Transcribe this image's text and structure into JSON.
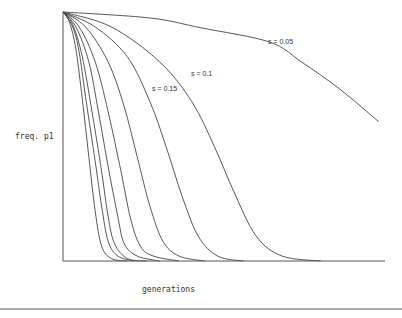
{
  "chart_data": {
    "type": "line",
    "title": "",
    "xlabel": "generations",
    "ylabel": "freq. p1",
    "xlim": [
      0,
      100
    ],
    "ylim": [
      0,
      1
    ],
    "grid": false,
    "legend": "inline curve labels",
    "series": [
      {
        "name": "curve-1",
        "label": "",
        "points": [
          [
            0,
            1
          ],
          [
            2,
            0.96
          ],
          [
            4,
            0.85
          ],
          [
            6,
            0.65
          ],
          [
            8,
            0.42
          ],
          [
            10,
            0.2
          ],
          [
            12,
            0.06
          ],
          [
            15,
            0.01
          ],
          [
            20,
            0
          ]
        ]
      },
      {
        "name": "curve-2",
        "label": "",
        "points": [
          [
            0,
            1
          ],
          [
            3,
            0.94
          ],
          [
            5,
            0.84
          ],
          [
            7,
            0.66
          ],
          [
            10,
            0.4
          ],
          [
            12,
            0.22
          ],
          [
            14,
            0.08
          ],
          [
            17,
            0.02
          ],
          [
            22,
            0
          ]
        ]
      },
      {
        "name": "curve-3",
        "label": "",
        "points": [
          [
            0,
            1
          ],
          [
            3,
            0.95
          ],
          [
            6,
            0.82
          ],
          [
            9,
            0.6
          ],
          [
            12,
            0.36
          ],
          [
            14,
            0.18
          ],
          [
            16,
            0.07
          ],
          [
            20,
            0.01
          ],
          [
            26,
            0
          ]
        ]
      },
      {
        "name": "curve-4",
        "label": "",
        "points": [
          [
            0,
            1
          ],
          [
            4,
            0.94
          ],
          [
            8,
            0.8
          ],
          [
            11,
            0.6
          ],
          [
            14,
            0.38
          ],
          [
            17,
            0.18
          ],
          [
            19,
            0.07
          ],
          [
            23,
            0.02
          ],
          [
            30,
            0
          ]
        ]
      },
      {
        "name": "curve-5",
        "label": "",
        "points": [
          [
            0,
            1
          ],
          [
            5,
            0.94
          ],
          [
            10,
            0.8
          ],
          [
            14,
            0.6
          ],
          [
            18,
            0.36
          ],
          [
            21,
            0.17
          ],
          [
            24,
            0.06
          ],
          [
            28,
            0.02
          ],
          [
            36,
            0
          ]
        ]
      },
      {
        "name": "curve-6",
        "label": "",
        "points": [
          [
            0,
            1
          ],
          [
            7,
            0.94
          ],
          [
            14,
            0.8
          ],
          [
            19,
            0.62
          ],
          [
            23,
            0.42
          ],
          [
            27,
            0.22
          ],
          [
            31,
            0.08
          ],
          [
            36,
            0.02
          ],
          [
            44,
            0
          ]
        ]
      },
      {
        "name": "s=0.15",
        "label": "s = 0.15",
        "points": [
          [
            0,
            1
          ],
          [
            10,
            0.94
          ],
          [
            20,
            0.82
          ],
          [
            27,
            0.64
          ],
          [
            32,
            0.46
          ],
          [
            37,
            0.26
          ],
          [
            42,
            0.1
          ],
          [
            48,
            0.02
          ],
          [
            56,
            0
          ]
        ]
      },
      {
        "name": "s=0.1",
        "label": "s = 0.1",
        "points": [
          [
            0,
            1
          ],
          [
            15,
            0.94
          ],
          [
            30,
            0.8
          ],
          [
            40,
            0.64
          ],
          [
            47,
            0.46
          ],
          [
            53,
            0.28
          ],
          [
            60,
            0.1
          ],
          [
            68,
            0.02
          ],
          [
            80,
            0
          ]
        ]
      },
      {
        "name": "s=0.05",
        "label": "s = 0.05",
        "points": [
          [
            0,
            1
          ],
          [
            27,
            0.976
          ],
          [
            43,
            0.936
          ],
          [
            64,
            0.88
          ],
          [
            74,
            0.8
          ],
          [
            86,
            0.69
          ],
          [
            98,
            0.56
          ]
        ]
      }
    ],
    "annotations": [
      {
        "text": "s = 0.05",
        "x": 64,
        "y": 0.87
      },
      {
        "text": "s = 0.1",
        "x": 40,
        "y": 0.75
      },
      {
        "text": "s = 0.15",
        "x": 28,
        "y": 0.69
      }
    ]
  },
  "labels": {
    "ylabel": "freq. p1",
    "xlabel": "generations",
    "s005": "s = 0.05",
    "s01": "s = 0.1",
    "s015": "s = 0.15"
  }
}
